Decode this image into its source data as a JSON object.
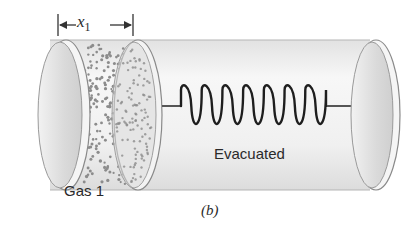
{
  "figure": {
    "panel_label": "(b)",
    "dimension_label": {
      "symbol": "x",
      "subscript": "1"
    },
    "labels": {
      "gas": "Gas 1",
      "evacuated": "Evacuated"
    },
    "components": [
      "cylinder",
      "left-end-cap",
      "gas-region",
      "piston",
      "rod-to-spring",
      "spring",
      "rod-to-end",
      "right-end-cap",
      "dimension-arrow"
    ],
    "spring_coils": 7,
    "colors": {
      "cylinder_fill": "#eeeeee",
      "cap_fill": "#d9d9d9",
      "outline": "#8a8a8a",
      "gas_dots": "#8c8c8c",
      "spring": "#1e1e1e",
      "text": "#2a2a2a"
    }
  }
}
